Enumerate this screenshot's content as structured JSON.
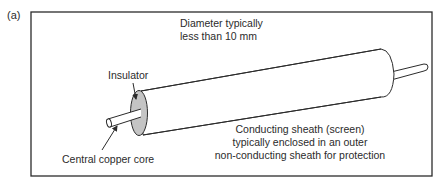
{
  "figure": {
    "panel_label": "(a)",
    "colors": {
      "outline": "#2b2b2b",
      "insulator_fill": "#c4c4c4",
      "background": "#ffffff"
    },
    "annotations": {
      "diameter": {
        "line1": "Diameter typically",
        "line2": "less than 10 mm"
      },
      "insulator": "Insulator",
      "core": "Central copper core",
      "sheath": {
        "line1": "Conducting sheath (screen)",
        "line2": "typically enclosed in an outer",
        "line3": "non-conducting sheath for protection"
      }
    }
  }
}
